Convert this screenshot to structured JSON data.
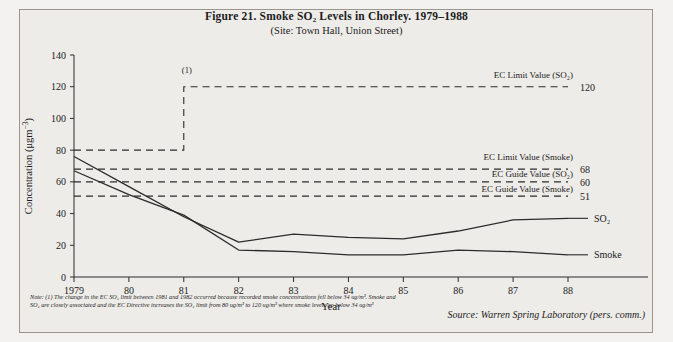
{
  "figure": {
    "title": "Figure 21.  Smoke SO₂ Levels in Chorley. 1979–1988",
    "subtitle": "(Site: Town Hall, Union Street)",
    "note": "Note: (1) The change in the EC SO₂ limit between 1981 and 1982 occurred because recorded smoke concentrations fell below 34 ug/m³. Smoke and SO₂ are closely associated and the EC Directive increases the SO₂ limit from 80 ug/m³ to 120 ug/m³ where smoke levels go below 34 ug/m³",
    "source": "Source: Warren Spring Laboratory (pers. comm.)",
    "callout": "(1)"
  },
  "chart_data": {
    "type": "line",
    "title": "Figure 21.  Smoke SO₂ Levels in Chorley. 1979–1988",
    "subtitle": "(Site: Town Hall, Union Street)",
    "xlabel": "Year",
    "ylabel": "Concentration (μgm⁻³)",
    "x": [
      1979,
      1980,
      1981,
      1982,
      1983,
      1984,
      1985,
      1986,
      1987,
      1988
    ],
    "categories": [
      "1979",
      "80",
      "81",
      "82",
      "83",
      "84",
      "85",
      "86",
      "87",
      "88"
    ],
    "xlim": [
      1979,
      1988
    ],
    "ylim": [
      0,
      140
    ],
    "yticks": [
      0,
      20,
      40,
      60,
      80,
      100,
      120,
      140
    ],
    "grid": false,
    "legend": "right-inline-labels",
    "series": [
      {
        "name": "SO₂",
        "label": "SO₂",
        "color": "#2b2b2b",
        "values": [
          76,
          57,
          38,
          22,
          27,
          25,
          24,
          29,
          36,
          37
        ]
      },
      {
        "name": "Smoke",
        "label": "Smoke",
        "color": "#2b2b2b",
        "values": [
          67,
          52,
          39,
          17,
          16,
          14,
          14,
          17,
          16,
          14
        ]
      }
    ],
    "reference_lines": [
      {
        "name": "ec-limit-so2",
        "label": "EC Limit Value (SO₂)",
        "value": 120,
        "value_text": "120",
        "style": "dashed-step",
        "step": {
          "before": 80,
          "after": 120,
          "break_at": 1981
        }
      },
      {
        "name": "ec-limit-smoke",
        "label": "EC Limit Value (Smoke)",
        "value": 68,
        "value_text": "68",
        "style": "dashed"
      },
      {
        "name": "ec-guide-so2",
        "label": "EC Guide Value (SO₂)",
        "value": 60,
        "value_text": "60",
        "style": "dashed"
      },
      {
        "name": "ec-guide-smoke",
        "label": "EC Guide Value (Smoke)",
        "value": 51,
        "value_text": "51",
        "style": "dashed"
      }
    ]
  },
  "axis": {
    "y_tick_labels": [
      "140",
      "120",
      "100",
      "80",
      "60",
      "40",
      "20",
      "0"
    ],
    "x_tick_labels": [
      "1979",
      "80",
      "81",
      "82",
      "83",
      "84",
      "85",
      "86",
      "87",
      "88"
    ],
    "x_title": "Year",
    "y_title_pre": "Concentration (μgm",
    "y_title_sup": "−3",
    "y_title_post": ")"
  },
  "labels": {
    "ec_limit_so2": "EC Limit Value (SO₂)",
    "ec_limit_so2_value": "120",
    "ec_limit_smoke": "EC Limit Value (Smoke)",
    "ec_limit_smoke_value": "68",
    "ec_guide_so2": "EC Guide Value (SO₂)",
    "ec_guide_so2_value": "60",
    "ec_guide_smoke": "EC Guide Value (Smoke)",
    "ec_guide_smoke_value": "51",
    "series_so2": "SO₂",
    "series_smoke": "Smoke"
  }
}
